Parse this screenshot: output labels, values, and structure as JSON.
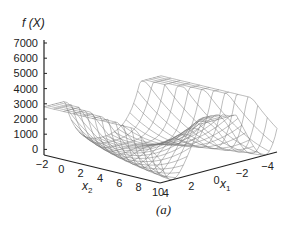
{
  "chart_data": {
    "type": "surface3d",
    "title": "",
    "zlabel": "f (X)",
    "xlabel": "x2",
    "ylabel": "x1",
    "caption": "(a)",
    "z_ticks": [
      0,
      1000,
      2000,
      3000,
      4000,
      5000,
      6000,
      7000
    ],
    "x2_ticks": [
      -2,
      0,
      2,
      4,
      6,
      8,
      10
    ],
    "x1_ticks": [
      4,
      2,
      0,
      -2,
      -4
    ],
    "x2_range": [
      -2,
      10
    ],
    "x1_range": [
      -4,
      4
    ],
    "z_range": [
      0,
      7000
    ],
    "grid": false
  },
  "axes": {
    "z_label": "f (X)",
    "x2_label": "x",
    "x2_sub": "2",
    "x1_label": "x",
    "x1_sub": "1",
    "z_tick_labels": [
      "7000",
      "6000",
      "5000",
      "4000",
      "3000",
      "2000",
      "1000",
      "0"
    ],
    "x2_tick_labels": [
      "-2",
      "0",
      "2",
      "4",
      "6",
      "8",
      "10"
    ],
    "x1_tick_labels": [
      "4",
      "2",
      "0",
      "-2",
      "-4"
    ]
  },
  "caption": "(a)",
  "style": {
    "mesh_color": "#7a7a7a",
    "axis_color": "#222222"
  }
}
